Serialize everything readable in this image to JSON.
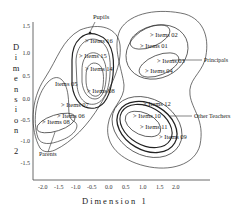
{
  "diagram": {
    "x_axis": {
      "title": "Dimension 1",
      "ticks": [
        "-2.0",
        "-1.5",
        "-1.0",
        "-0.5",
        "0.0",
        "0.5",
        "1.0",
        "1.5",
        "2.0"
      ]
    },
    "y_axis": {
      "title_letters": [
        "D",
        "i",
        "m",
        "e",
        "n",
        "s",
        "i",
        "o",
        "n",
        "",
        "2"
      ],
      "ticks": [
        "1.5",
        "1.0",
        "0.5",
        "0.0",
        "-0.5",
        "-1.0",
        "-1.5"
      ]
    },
    "groups": [
      {
        "name": "Pupils",
        "items": [
          "Items 16",
          "Items 15",
          "Items 14",
          "Items 08"
        ]
      },
      {
        "name": "Parents",
        "items": [
          "Items 05",
          "Items 07",
          "Items 06",
          "Items 08"
        ]
      },
      {
        "name": "Principals",
        "items": [
          "Items 02",
          "Items 01",
          "Items 03",
          "Items 04"
        ]
      },
      {
        "name": "Other Teachers",
        "items": [
          "Items 12",
          "Items 10",
          "Items 11",
          "Items 09"
        ]
      }
    ],
    "item_labels": {
      "pupils_1": "> Items 16",
      "pupils_2": "> Items 15",
      "pupils_3": "> Items 14",
      "pupils_4": "> Items 08",
      "parents_1": "Items 05",
      "parents_2": "> Items 07",
      "parents_3": "> Items 06",
      "parents_4": "> Items 08",
      "principals_1": "> Items 02",
      "principals_2": "> Items 01",
      "principals_3": "> Items 03",
      "principals_4": "> Items 04",
      "teachers_1": "> Items 12",
      "teachers_2": "> Items 10",
      "teachers_3": "> Items 11",
      "teachers_4": "> Items 09"
    },
    "callouts": {
      "pupils": "Pupils",
      "principals": "Principals",
      "other_teachers": "Other Teachers",
      "parents": "Parents"
    }
  }
}
